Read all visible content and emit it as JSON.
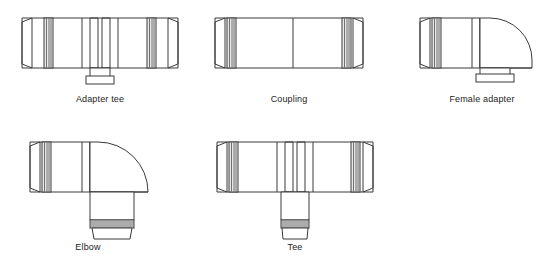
{
  "page": {
    "background_color": "#ffffff",
    "line_color": "#3a3a3a",
    "rib_color": "#6f6f6f",
    "band_fill_color": "#e9e9e9",
    "text_color": "#1c1c1c",
    "width": 551,
    "height": 269
  },
  "figures": [
    {
      "id": "adapter-tee",
      "label": "Adapter tee",
      "row": 1,
      "column": 1,
      "shape": "tee",
      "ends": [
        "ribbed-spigot-left",
        "ribbed-spigot-right",
        "plain-socket-bottom"
      ]
    },
    {
      "id": "coupling",
      "label": "Coupling",
      "row": 1,
      "column": 2,
      "shape": "straight",
      "ends": [
        "ribbed-spigot-left",
        "ribbed-spigot-right"
      ]
    },
    {
      "id": "female-adapter",
      "label": "Female adapter",
      "row": 1,
      "column": 3,
      "shape": "elbow",
      "ends": [
        "ribbed-spigot-left",
        "plain-socket-bottom"
      ]
    },
    {
      "id": "elbow",
      "label": "Elbow",
      "row": 2,
      "column": 1,
      "shape": "elbow",
      "ends": [
        "ribbed-spigot-left",
        "ribbed-socket-bottom"
      ]
    },
    {
      "id": "tee",
      "label": "Tee",
      "row": 2,
      "column": 2,
      "shape": "tee",
      "ends": [
        "ribbed-spigot-left",
        "ribbed-spigot-right",
        "ribbed-socket-bottom"
      ]
    }
  ]
}
